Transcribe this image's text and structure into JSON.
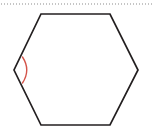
{
  "canvas": {
    "width": 153,
    "height": 132,
    "background": "#ffffff",
    "name": "geometry-figure-hexagon-with-marked-angle"
  },
  "colors": {
    "outline": "#231f20",
    "angle_arc": "#d4544a",
    "dotted_rule": "#8c8c8c",
    "background": "#ffffff"
  },
  "chart_data": {
    "type": "diagram",
    "title": "",
    "subtitle": "",
    "xlabel": "",
    "ylabel": "",
    "annotations": [],
    "shapes": [
      {
        "id": "hexagon",
        "kind": "polygon",
        "label": "hexagon",
        "closed": true,
        "sides": 6,
        "fill": "none",
        "stroke": "#231f20",
        "stroke_width": 1.7,
        "vertices": [
          {
            "name": "top-left",
            "x": 41,
            "y": 14
          },
          {
            "name": "top-right",
            "x": 110,
            "y": 14
          },
          {
            "name": "right",
            "x": 138,
            "y": 70
          },
          {
            "name": "bottom-right",
            "x": 110,
            "y": 125
          },
          {
            "name": "bottom-left",
            "x": 41,
            "y": 125
          },
          {
            "name": "left",
            "x": 14,
            "y": 70
          }
        ]
      },
      {
        "id": "angle-arc",
        "kind": "arc",
        "label": "interior-angle-marker",
        "at_vertex": "left",
        "fill": "none",
        "stroke": "#d4544a",
        "stroke_width": 1.4,
        "path": "M 22.5 57 Q 31 70 22.5 83",
        "start": {
          "x": 22.5,
          "y": 57
        },
        "end": {
          "x": 22.5,
          "y": 83
        },
        "bulge_toward": "interior-right"
      },
      {
        "id": "dotted-rule",
        "kind": "line",
        "label": "dotted-horizontal-rule",
        "stroke": "#8c8c8c",
        "stroke_width": 1.1,
        "dash_pattern": "1 2",
        "x1": 1,
        "y1": 4,
        "x2": 152,
        "y2": 4
      }
    ]
  }
}
